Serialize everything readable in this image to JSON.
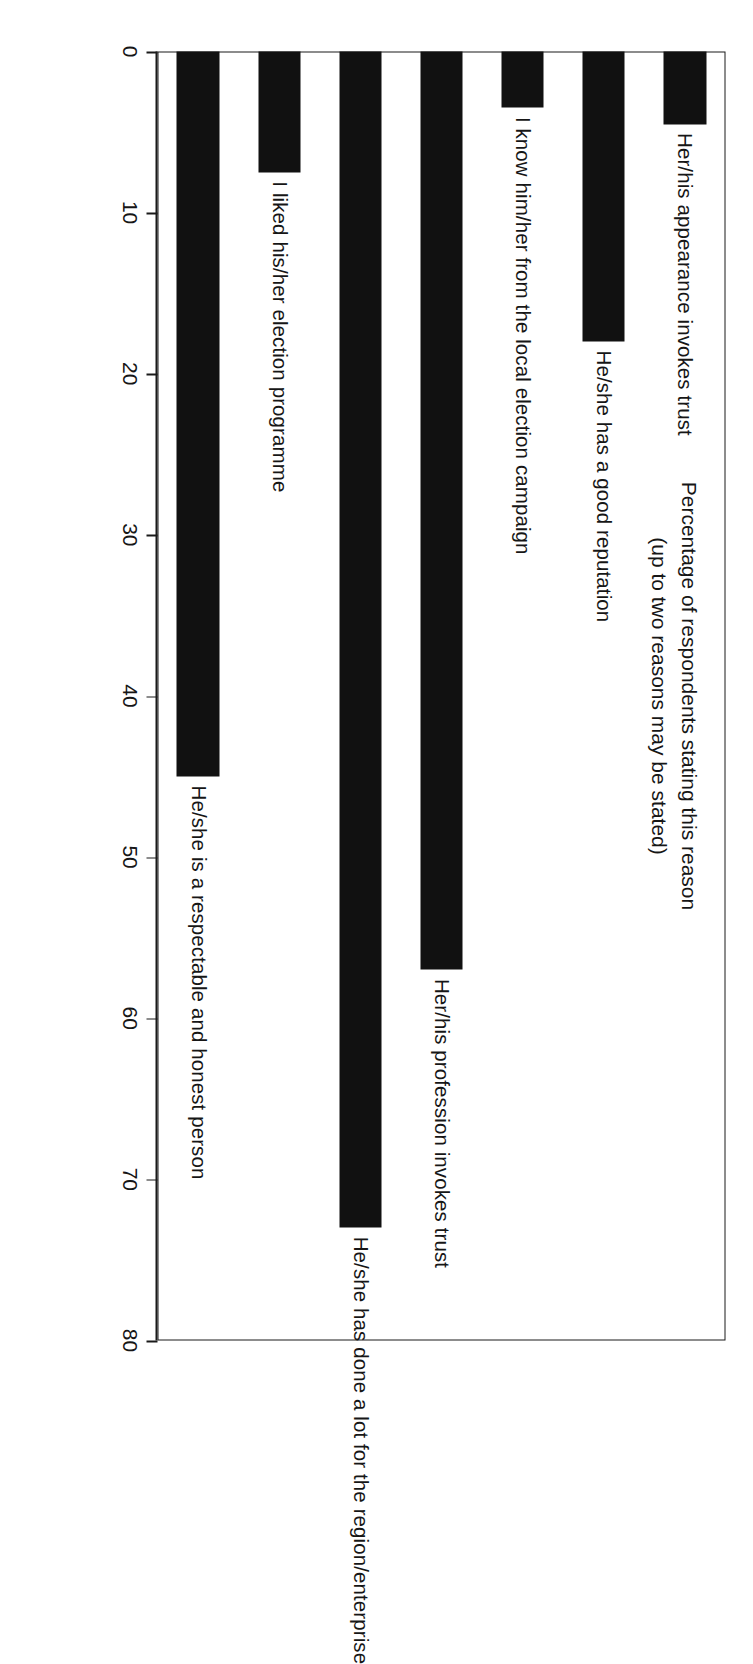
{
  "chart_data": {
    "type": "bar",
    "orientation": "vertical-in-print",
    "title": "",
    "subtitle": "",
    "xlabel": "",
    "ylabel": "Percentage of respondents stating this reason (up to two reasons may be stated)",
    "ylabel_line1": "Percentage of respondents stating this reason",
    "ylabel_line2": "(up to two reasons may be stated)",
    "ylim": [
      0,
      80
    ],
    "ytick_step": 10,
    "ytick_labels": [
      "0",
      "10",
      "20",
      "30",
      "40",
      "50",
      "60",
      "70",
      "80"
    ],
    "ytick_values": [
      0,
      10,
      20,
      30,
      40,
      50,
      60,
      70,
      80
    ],
    "grid": false,
    "legend": false,
    "bar_color": "#111111",
    "frame_color": "#1a1a1a",
    "background": "#ffffff",
    "categories": [
      "Her/his appearance invokes trust",
      "He/she has a good reputation",
      "I know him/her from the local election campaign",
      "Her/his profession invokes trust",
      "He/she has done a lot for the region/enterprise",
      "I liked his/her election programme",
      "He/she is a respectable and honest person"
    ],
    "values": [
      4.5,
      18,
      3.5,
      57,
      73,
      7.5,
      45
    ]
  }
}
